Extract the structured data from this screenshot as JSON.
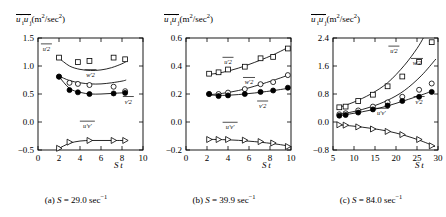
{
  "figure": {
    "ylabel_text": "u'_i u'_j (m^2/sec^2)",
    "xlabel_text": "S t",
    "curve_labels": {
      "uu": "u'2",
      "ww": "w'2",
      "vv": "v'2",
      "uv": "u'v'"
    }
  },
  "panels": [
    {
      "id": "a",
      "caption": "(a) S = 29.0 sec−1",
      "caption_parts": {
        "tag": "(a)",
        "sym": "S",
        "eq": "=",
        "value": "29.0",
        "unit": "sec",
        "exp": "−1"
      },
      "xticks": [
        0,
        2,
        4,
        6,
        8,
        10
      ],
      "xticklabels": [
        "0",
        "2",
        "4",
        "6",
        "8",
        "10"
      ],
      "yticks": [
        -0.5,
        0.0,
        0.5,
        1.0,
        1.5
      ],
      "yticklabels": [
        "-0.5",
        "0.0",
        "0.5",
        "1.0",
        "1.5"
      ],
      "xlim": [
        0,
        10
      ],
      "ylim": [
        -0.5,
        1.5
      ]
    },
    {
      "id": "b",
      "caption": "(b) S = 39.9 sec−1",
      "caption_parts": {
        "tag": "(b)",
        "sym": "S",
        "eq": "=",
        "value": "39.9",
        "unit": "sec",
        "exp": "−1"
      },
      "xticks": [
        0,
        2,
        4,
        6,
        8,
        10
      ],
      "xticklabels": [
        "0",
        "2",
        "4",
        "6",
        "8",
        "10"
      ],
      "yticks": [
        -0.2,
        0.0,
        0.2,
        0.4,
        0.6
      ],
      "yticklabels": [
        "-0.2",
        "0.0",
        "0.2",
        "0.4",
        "0.6"
      ],
      "xlim": [
        0,
        10
      ],
      "ylim": [
        -0.2,
        0.6
      ]
    },
    {
      "id": "c",
      "caption": "(c) S = 84.0 sec−1",
      "caption_parts": {
        "tag": "(c)",
        "sym": "S",
        "eq": "=",
        "value": "84.0",
        "unit": "sec",
        "exp": "−1"
      },
      "xticks": [
        5,
        10,
        15,
        20,
        25,
        30
      ],
      "xticklabels": [
        "5",
        "10",
        "15",
        "20",
        "25",
        "30"
      ],
      "yticks": [
        -0.8,
        0.0,
        0.8,
        1.6,
        2.4
      ],
      "yticklabels": [
        "-0.8",
        "0.0",
        "0.8",
        "1.6",
        "2.4"
      ],
      "xlim": [
        5,
        30
      ],
      "ylim": [
        -0.8,
        2.4
      ]
    }
  ],
  "chart_data": [
    {
      "type": "scatter",
      "panel": "a",
      "title": "(a) S = 29.0 sec-1",
      "xlabel": "S t",
      "ylabel": "u'_i u'_j (m^2/sec^2)",
      "xlim": [
        0,
        10
      ],
      "ylim": [
        -0.5,
        1.5
      ],
      "grid": false,
      "legend": "inline-curve-labels",
      "series": [
        {
          "name": "u'2",
          "marker": "open-square",
          "x": [
            2.0,
            3.8,
            4.9,
            7.2,
            8.3
          ],
          "y": [
            1.15,
            1.07,
            1.09,
            1.15,
            1.12
          ]
        },
        {
          "name": "w'2",
          "marker": "open-circle",
          "x": [
            2.0,
            3.0,
            3.8,
            4.9,
            7.2,
            8.3
          ],
          "y": [
            0.81,
            0.7,
            0.68,
            0.66,
            0.63,
            0.55
          ]
        },
        {
          "name": "v'2",
          "marker": "filled-circle",
          "x": [
            2.0,
            3.0,
            3.8,
            4.9,
            7.2,
            8.3
          ],
          "y": [
            0.81,
            0.57,
            0.53,
            0.5,
            0.51,
            0.52
          ]
        },
        {
          "name": "u'v'",
          "marker": "open-triangle-right",
          "x": [
            2.0,
            3.0,
            4.9,
            7.2,
            8.3
          ],
          "y": [
            -0.47,
            -0.36,
            -0.33,
            -0.33,
            -0.33
          ]
        }
      ],
      "fit_curves": [
        {
          "name": "u'2-fit",
          "x": [
            2.0,
            3.0,
            4.0,
            5.0,
            6.0,
            7.0,
            8.0,
            8.4
          ],
          "y": [
            1.14,
            1.0,
            0.94,
            0.92,
            0.93,
            0.97,
            1.04,
            1.08
          ]
        },
        {
          "name": "w'2-fit",
          "x": [
            2.0,
            3.0,
            4.0,
            5.0,
            6.0,
            7.0,
            8.0,
            8.4
          ],
          "y": [
            0.82,
            0.74,
            0.7,
            0.68,
            0.68,
            0.7,
            0.73,
            0.75
          ]
        },
        {
          "name": "v'2-fit",
          "x": [
            2.0,
            3.0,
            4.0,
            5.0,
            6.0,
            7.0,
            8.0,
            8.4
          ],
          "y": [
            0.81,
            0.6,
            0.53,
            0.5,
            0.5,
            0.51,
            0.52,
            0.52
          ]
        },
        {
          "name": "u'v'-fit",
          "x": [
            2.0,
            3.0,
            4.0,
            5.0,
            6.0,
            7.0,
            8.0,
            8.4
          ],
          "y": [
            -0.47,
            -0.38,
            -0.34,
            -0.33,
            -0.33,
            -0.33,
            -0.33,
            -0.33
          ]
        }
      ]
    },
    {
      "type": "scatter",
      "panel": "b",
      "title": "(b) S = 39.9 sec-1",
      "xlabel": "S t",
      "ylabel": "u'_i u'_j (m^2/sec^2)",
      "xlim": [
        0,
        10
      ],
      "ylim": [
        -0.2,
        0.6
      ],
      "grid": false,
      "legend": "inline-curve-labels",
      "series": [
        {
          "name": "u'2",
          "marker": "open-square",
          "x": [
            2.2,
            3.1,
            4.0,
            5.6,
            7.1,
            8.3,
            9.7
          ],
          "y": [
            0.345,
            0.355,
            0.375,
            0.395,
            0.455,
            0.465,
            0.525
          ]
        },
        {
          "name": "w'2",
          "marker": "open-circle",
          "x": [
            2.2,
            3.1,
            4.0,
            5.6,
            7.1,
            8.3,
            9.7
          ],
          "y": [
            0.2,
            0.2,
            0.21,
            0.235,
            0.27,
            0.285,
            0.335
          ]
        },
        {
          "name": "v'2",
          "marker": "filled-circle",
          "x": [
            2.2,
            3.1,
            4.0,
            5.6,
            7.1,
            8.3,
            9.7
          ],
          "y": [
            0.2,
            0.185,
            0.19,
            0.2,
            0.215,
            0.225,
            0.245
          ]
        },
        {
          "name": "u'v'",
          "marker": "open-triangle-right",
          "x": [
            2.2,
            3.1,
            4.0,
            5.6,
            7.1,
            8.3,
            9.7
          ],
          "y": [
            -0.125,
            -0.125,
            -0.125,
            -0.13,
            -0.14,
            -0.15,
            -0.175
          ]
        }
      ],
      "fit_curves": [
        {
          "name": "u'2-fit",
          "x": [
            2.2,
            3.5,
            5.0,
            6.5,
            8.0,
            9.0,
            9.9
          ],
          "y": [
            0.34,
            0.355,
            0.385,
            0.425,
            0.47,
            0.505,
            0.54
          ]
        },
        {
          "name": "w'2-fit",
          "x": [
            2.2,
            3.5,
            5.0,
            6.5,
            8.0,
            9.0,
            9.9
          ],
          "y": [
            0.195,
            0.205,
            0.225,
            0.255,
            0.29,
            0.315,
            0.34
          ]
        },
        {
          "name": "v'2-fit",
          "x": [
            2.2,
            3.5,
            5.0,
            6.5,
            8.0,
            9.0,
            9.9
          ],
          "y": [
            0.193,
            0.19,
            0.196,
            0.207,
            0.221,
            0.232,
            0.243
          ]
        },
        {
          "name": "u'v'-fit",
          "x": [
            2.2,
            3.5,
            5.0,
            6.5,
            8.0,
            9.0,
            9.9
          ],
          "y": [
            -0.124,
            -0.126,
            -0.131,
            -0.14,
            -0.152,
            -0.162,
            -0.174
          ]
        }
      ]
    },
    {
      "type": "scatter",
      "panel": "c",
      "title": "(c) S = 84.0 sec-1",
      "xlabel": "S t",
      "ylabel": "u'_i u'_j (m^2/sec^2)",
      "xlim": [
        5,
        30
      ],
      "ylim": [
        -0.8,
        2.4
      ],
      "grid": false,
      "legend": "inline-curve-labels",
      "series": [
        {
          "name": "u'2",
          "marker": "open-square",
          "x": [
            6.5,
            8.0,
            11.0,
            14.5,
            18.0,
            21.5,
            25.5,
            28.5
          ],
          "y": [
            0.42,
            0.44,
            0.6,
            0.78,
            1.02,
            1.3,
            1.72,
            2.28
          ]
        },
        {
          "name": "w'2",
          "marker": "open-circle",
          "x": [
            6.5,
            8.0,
            11.0,
            14.5,
            18.0,
            21.5,
            25.5,
            28.5
          ],
          "y": [
            0.22,
            0.25,
            0.33,
            0.44,
            0.56,
            0.72,
            0.92,
            1.1
          ]
        },
        {
          "name": "v'2",
          "marker": "filled-circle",
          "x": [
            6.5,
            8.0,
            11.0,
            14.5,
            18.0,
            21.5,
            25.5,
            28.5
          ],
          "y": [
            0.18,
            0.2,
            0.27,
            0.36,
            0.47,
            0.6,
            0.72,
            0.86
          ]
        },
        {
          "name": "u'v'",
          "marker": "open-triangle-right",
          "x": [
            6.5,
            8.0,
            11.0,
            14.5,
            18.0,
            21.5,
            25.5,
            28.5
          ],
          "y": [
            -0.08,
            -0.09,
            -0.14,
            -0.2,
            -0.27,
            -0.36,
            -0.5,
            -0.68
          ]
        }
      ],
      "fit_curves": [
        {
          "name": "u'2-fit",
          "x": [
            6.5,
            10,
            14,
            18,
            22,
            25,
            26.5
          ],
          "y": [
            0.42,
            0.57,
            0.8,
            1.12,
            1.62,
            2.1,
            2.4
          ]
        },
        {
          "name": "w'2-fit",
          "x": [
            6.5,
            10,
            14,
            18,
            22,
            26,
            29.5
          ],
          "y": [
            0.22,
            0.3,
            0.43,
            0.62,
            0.9,
            1.32,
            1.8
          ]
        },
        {
          "name": "v'2-fit",
          "x": [
            6.5,
            10,
            14,
            18,
            22,
            26,
            29
          ],
          "y": [
            0.18,
            0.25,
            0.34,
            0.46,
            0.61,
            0.77,
            0.9
          ]
        },
        {
          "name": "u'v'-fit",
          "x": [
            6.5,
            10,
            14,
            18,
            22,
            26,
            29.3
          ],
          "y": [
            -0.08,
            -0.12,
            -0.18,
            -0.26,
            -0.38,
            -0.54,
            -0.7
          ]
        }
      ]
    }
  ]
}
